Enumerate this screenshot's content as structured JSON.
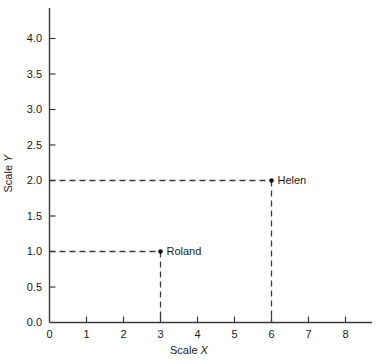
{
  "chart_data": {
    "type": "scatter",
    "title": "",
    "xlabel": "Scale X",
    "ylabel": "Scale Y",
    "xlim": [
      0,
      8
    ],
    "ylim": [
      0.0,
      4.0
    ],
    "grid": false,
    "legend": "none",
    "x_ticks": [
      "0",
      "1",
      "2",
      "3",
      "4",
      "5",
      "6",
      "7",
      "8"
    ],
    "x_tick_values": [
      0,
      1,
      2,
      3,
      4,
      5,
      6,
      7,
      8
    ],
    "y_ticks": [
      "0.0",
      "0.5",
      "1.0",
      "1.5",
      "2.0",
      "2.5",
      "3.0",
      "3.5",
      "4.0"
    ],
    "y_tick_values": [
      0.0,
      0.5,
      1.0,
      1.5,
      2.0,
      2.5,
      3.0,
      3.5,
      4.0
    ],
    "points": [
      {
        "label": "Roland",
        "x": 3,
        "y": 1.0
      },
      {
        "label": "Helen",
        "x": 6,
        "y": 2.0
      }
    ],
    "annotations": [
      "Dashed guide lines drop from each point to the x-axis and extend left to the y-axis"
    ],
    "colors": {
      "axis": "#3a3a3a",
      "guide_line": "#3a3a3a",
      "point": "#101010",
      "text": "#1a1a1a",
      "background": "#ffffff"
    }
  },
  "xaxis_title": {
    "prefix": "Scale ",
    "variable": "X"
  },
  "yaxis_title": {
    "prefix": "Scale ",
    "variable": "Y"
  }
}
